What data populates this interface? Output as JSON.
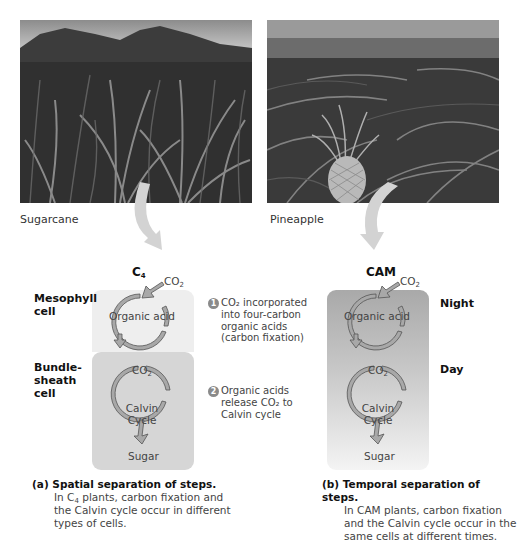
{
  "photos": {
    "left": {
      "label": "Sugarcane",
      "subject": "sugarcane-field-photo"
    },
    "right": {
      "label": "Pineapple",
      "subject": "pineapple-field-photo"
    }
  },
  "c4": {
    "title_main": "C",
    "title_sub": "4",
    "co2_in": {
      "main": "CO",
      "sub": "2"
    },
    "mesophyll_label_1": "Mesophyll",
    "mesophyll_label_2": "cell",
    "bundle_label_1": "Bundle-",
    "bundle_label_2": "sheath",
    "bundle_label_3": "cell",
    "organic_acid": "Organic acid",
    "co2_mid": {
      "main": "CO",
      "sub": "2"
    },
    "calvin_1": "Calvin",
    "calvin_2": "Cycle",
    "sugar": "Sugar",
    "colors": {
      "mesophyll": "#eeeeee",
      "bundle_sheath": "#d6d6d6",
      "arrow_fill": "#a8a8a8",
      "arrow_stroke": "#555555"
    }
  },
  "steps": [
    {
      "num": "1",
      "lines": [
        "CO₂ incorporated",
        "into four-carbon",
        "organic acids",
        "(carbon fixation)"
      ]
    },
    {
      "num": "2",
      "lines": [
        "Organic acids",
        "release CO₂ to",
        "Calvin cycle"
      ]
    }
  ],
  "cam": {
    "title": "CAM",
    "co2_in": {
      "main": "CO",
      "sub": "2"
    },
    "night": "Night",
    "day": "Day",
    "organic_acid": "Organic acid",
    "co2_mid": {
      "main": "CO",
      "sub": "2"
    },
    "calvin_1": "Calvin",
    "calvin_2": "Cycle",
    "sugar": "Sugar",
    "colors": {
      "gradient_top": "#a9a9a9",
      "gradient_bottom": "#f4f4f4"
    }
  },
  "captions": {
    "a": {
      "head": "(a) Spatial separation of steps.",
      "line1_pre": "In C",
      "line1_sub": "4",
      "line1_post": " plants, carbon fixation and",
      "line2": "the Calvin cycle occur in different",
      "line3": "types of cells."
    },
    "b": {
      "head": "(b) Temporal separation of steps.",
      "line1": "In CAM plants, carbon fixation",
      "line2": "and the Calvin cycle occur in the",
      "line3": "same cells at different times."
    }
  }
}
